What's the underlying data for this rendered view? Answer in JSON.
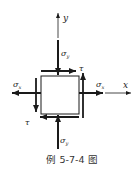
{
  "figure": {
    "caption": "例 5-7-4 图",
    "axes": {
      "x_label": "x",
      "y_label": "y"
    },
    "labels": {
      "sigma_y_top": "σ",
      "sigma_y_top_sub": "y",
      "sigma_y_bottom": "σ",
      "sigma_y_bottom_sub": "y",
      "sigma_x_left": "σ",
      "sigma_x_left_sub": "x",
      "sigma_x_right": "σ",
      "sigma_x_right_sub": "x",
      "tau_top_right": "τ",
      "tau_bottom_left": "τ"
    },
    "colors": {
      "stroke": "#1a1a1a",
      "background": "#ffffff"
    }
  }
}
